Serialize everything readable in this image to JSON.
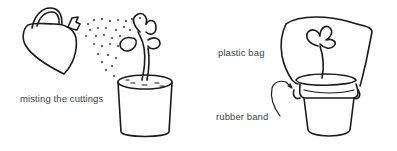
{
  "figure": {
    "left_panel": {
      "caption": "misting the cuttings",
      "objects": [
        "watering-can",
        "water-spray",
        "potted-cutting"
      ]
    },
    "right_panel": {
      "labels": {
        "bag": "plastic bag",
        "band": "rubber band"
      },
      "objects": [
        "plastic-bag",
        "potted-cutting",
        "rubber-band"
      ]
    },
    "colors": {
      "ink": "#1a1a1a",
      "text": "#444444",
      "background": "#ffffff"
    }
  }
}
